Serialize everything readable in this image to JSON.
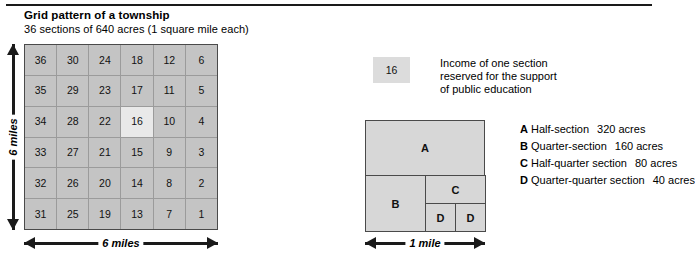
{
  "header": {
    "title": "Grid pattern of a township",
    "subtitle": "36 sections of 640 acres (1 square mile each)"
  },
  "township": {
    "rows": [
      [
        "36",
        "30",
        "24",
        "18",
        "12",
        "6"
      ],
      [
        "35",
        "29",
        "23",
        "17",
        "11",
        "5"
      ],
      [
        "34",
        "28",
        "22",
        "16",
        "10",
        "4"
      ],
      [
        "33",
        "27",
        "21",
        "15",
        "9",
        "3"
      ],
      [
        "32",
        "26",
        "20",
        "14",
        "8",
        "2"
      ],
      [
        "31",
        "25",
        "19",
        "13",
        "7",
        "1"
      ]
    ],
    "highlighted_section": "16",
    "width_label": "6 miles",
    "height_label": "6 miles",
    "cell_color": "#c4c4c4",
    "highlight_color": "#e9e9e9"
  },
  "education_legend": {
    "swatch_value": "16",
    "swatch_color": "#dcdcdc",
    "description_lines": [
      "Income of one section",
      "reserved for the support",
      "of public education"
    ]
  },
  "section_diagram": {
    "width_label": "1 mile",
    "fill_color": "#d7d7d7",
    "parts": [
      {
        "letter": "A"
      },
      {
        "letter": "B"
      },
      {
        "letter": "C"
      },
      {
        "letter": "D"
      },
      {
        "letter": "D"
      }
    ]
  },
  "key": {
    "items": [
      {
        "letter": "A",
        "name": "Half-section",
        "acres": "320 acres"
      },
      {
        "letter": "B",
        "name": "Quarter-section",
        "acres": "160 acres"
      },
      {
        "letter": "C",
        "name": "Half-quarter section",
        "acres": "80 acres"
      },
      {
        "letter": "D",
        "name": "Quarter-quarter section",
        "acres": "40 acres"
      }
    ]
  }
}
